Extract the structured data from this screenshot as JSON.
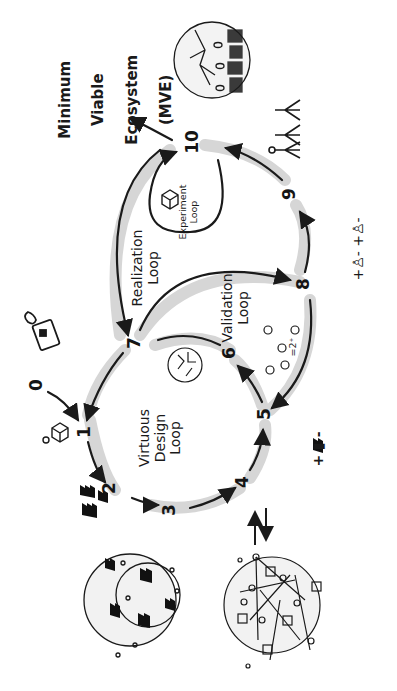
{
  "title": "Minimum Viable Ecosystem (MVE)",
  "title_lines": [
    "Minimum",
    "Viable",
    "Ecosystem",
    "(MVE)"
  ],
  "loops": {
    "virtuous": {
      "label": "Virtuous\nDesign\nLoop"
    },
    "realization": {
      "label": "Realization\nLoop"
    },
    "validation": {
      "label": "Validation\nLoop"
    },
    "experiment": {
      "label": "Experiment\nLoop"
    }
  },
  "steps": [
    "0",
    "1",
    "2",
    "3",
    "4",
    "5",
    "6",
    "7",
    "8",
    "9",
    "10"
  ],
  "annotations": {
    "factory_plus_minus": "+ ▮ -",
    "people_plus_minus": "+♙- +♙-",
    "equation": "=2⁺",
    "exchange_arrows": "⇅"
  },
  "icons": [
    "cube-icon",
    "factory-icon",
    "heart-icon",
    "scroll-icon",
    "people-icon",
    "ecosystem-circle-icon",
    "network-circle-icon"
  ],
  "colors": {
    "ink": "#1a1a1a",
    "shadow": "#d4d4d4",
    "background": "#ffffff"
  }
}
